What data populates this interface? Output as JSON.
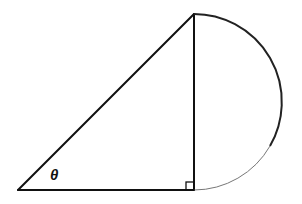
{
  "figure": {
    "angle_label": "θ",
    "right_angle_marker": true,
    "shapes": [
      "right-triangle",
      "semicircle"
    ]
  }
}
